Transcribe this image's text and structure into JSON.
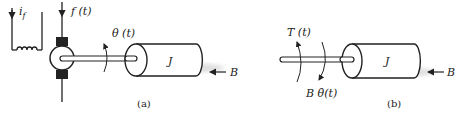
{
  "figure_a": {
    "caption": "(a)",
    "field_current_label": "i_f",
    "field_current_main": "i",
    "field_current_sub": "f",
    "armature_input_label": "f (t)",
    "angle_label": "θ (t)",
    "inertia_label": "J",
    "damping_label": "B"
  },
  "figure_b": {
    "caption": "(b)",
    "torque_label": "T (t)",
    "friction_torque_label": "B θ̇(t)",
    "inertia_label": "J",
    "damping_label": "B"
  },
  "colors": {
    "stroke": "#222222",
    "fill": "#ffffff",
    "shadow": "#d8d8d8"
  }
}
